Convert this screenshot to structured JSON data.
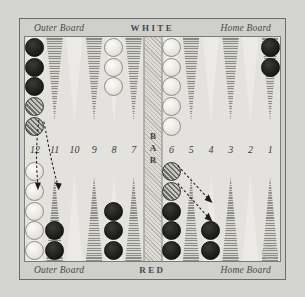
{
  "board": {
    "top_caption": {
      "left": "Outer Board",
      "center": "WHITE",
      "right": "Home Board"
    },
    "bottom_caption": {
      "left": "Outer Board",
      "center": "RED",
      "right": "Home Board"
    },
    "bar_label": "BAR",
    "point_numbers": [
      "12",
      "11",
      "10",
      "9",
      "8",
      "7",
      "6",
      "5",
      "4",
      "3",
      "2",
      "1"
    ],
    "colors": {
      "background": "#d4d4d2",
      "surface": "#e3e2df",
      "frame": "#6b6b68",
      "point_dark": "#8d8d87",
      "point_light": "#eceae6",
      "checker_dark": "#1d1d1c",
      "checker_light": "#e6e4de",
      "checker_moving": "#9c9a94",
      "text": "#3c3c3a"
    },
    "top_points": [
      {
        "number": "12",
        "triangle": "light",
        "checkers": [
          "dark",
          "dark",
          "dark",
          "moving",
          "moving"
        ]
      },
      {
        "number": "11",
        "triangle": "dark",
        "checkers": []
      },
      {
        "number": "10",
        "triangle": "light",
        "checkers": []
      },
      {
        "number": "9",
        "triangle": "dark",
        "checkers": []
      },
      {
        "number": "8",
        "triangle": "light",
        "checkers": [
          "light",
          "light",
          "light"
        ]
      },
      {
        "number": "7",
        "triangle": "dark",
        "checkers": []
      },
      {
        "number": "6",
        "triangle": "light",
        "checkers": [
          "light",
          "light",
          "light",
          "light",
          "light"
        ]
      },
      {
        "number": "5",
        "triangle": "dark",
        "checkers": []
      },
      {
        "number": "4",
        "triangle": "light",
        "checkers": []
      },
      {
        "number": "3",
        "triangle": "dark",
        "checkers": []
      },
      {
        "number": "2",
        "triangle": "light",
        "checkers": []
      },
      {
        "number": "1",
        "triangle": "dark",
        "checkers": [
          "dark",
          "dark"
        ]
      }
    ],
    "bottom_points": [
      {
        "number": "12",
        "triangle": "light",
        "checkers": [
          "light",
          "light",
          "light",
          "light",
          "light"
        ]
      },
      {
        "number": "11",
        "triangle": "dark",
        "checkers": [
          "dark",
          "dark"
        ]
      },
      {
        "number": "10",
        "triangle": "light",
        "checkers": []
      },
      {
        "number": "9",
        "triangle": "dark",
        "checkers": []
      },
      {
        "number": "8",
        "triangle": "light",
        "checkers": [
          "dark",
          "dark",
          "dark"
        ]
      },
      {
        "number": "7",
        "triangle": "dark",
        "checkers": []
      },
      {
        "number": "6",
        "triangle": "light",
        "checkers": [
          "dark",
          "dark",
          "dark",
          "moving",
          "moving"
        ]
      },
      {
        "number": "5",
        "triangle": "dark",
        "checkers": []
      },
      {
        "number": "4",
        "triangle": "light",
        "checkers": [
          "dark",
          "dark"
        ]
      },
      {
        "number": "3",
        "triangle": "dark",
        "checkers": []
      },
      {
        "number": "2",
        "triangle": "light",
        "checkers": []
      },
      {
        "number": "1",
        "triangle": "dark",
        "checkers": []
      }
    ],
    "move_arrows": [
      {
        "from": "top-12",
        "to": "bottom-11",
        "style": "dotted"
      },
      {
        "from": "top-12",
        "to": "bottom-11",
        "style": "dotted"
      },
      {
        "from": "bottom-6",
        "to": "bottom-4",
        "style": "dotted"
      },
      {
        "from": "bottom-6",
        "to": "bottom-4",
        "style": "dotted"
      }
    ]
  }
}
